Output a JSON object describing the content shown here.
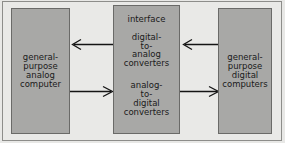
{
  "diagram": {
    "background_color": "#e8e8e6",
    "node_fill_color": "#a8a8a6",
    "node_border_color": "#6a6a68",
    "arrow_color": "#141414",
    "nodes": [
      {
        "id": "analog-computer",
        "lines": [
          "general-",
          "purpose",
          "analog",
          "computer"
        ]
      },
      {
        "id": "interface",
        "title": "interface",
        "dac_lines": [
          "digital-",
          "to-",
          "analog",
          "converters"
        ],
        "adc_lines": [
          "analog-",
          "to-",
          "digital",
          "converters"
        ]
      },
      {
        "id": "digital-computers",
        "lines": [
          "general-",
          "purpose",
          "digital",
          "computers"
        ]
      }
    ],
    "connectors": [
      {
        "id": "dac-to-analog",
        "from": "interface",
        "to": "analog-computer",
        "direction": "left"
      },
      {
        "id": "digital-to-dac",
        "from": "digital-computers",
        "to": "interface",
        "direction": "left"
      },
      {
        "id": "analog-to-adc",
        "from": "analog-computer",
        "to": "interface",
        "direction": "right"
      },
      {
        "id": "adc-to-digital",
        "from": "interface",
        "to": "digital-computers",
        "direction": "right"
      }
    ]
  }
}
